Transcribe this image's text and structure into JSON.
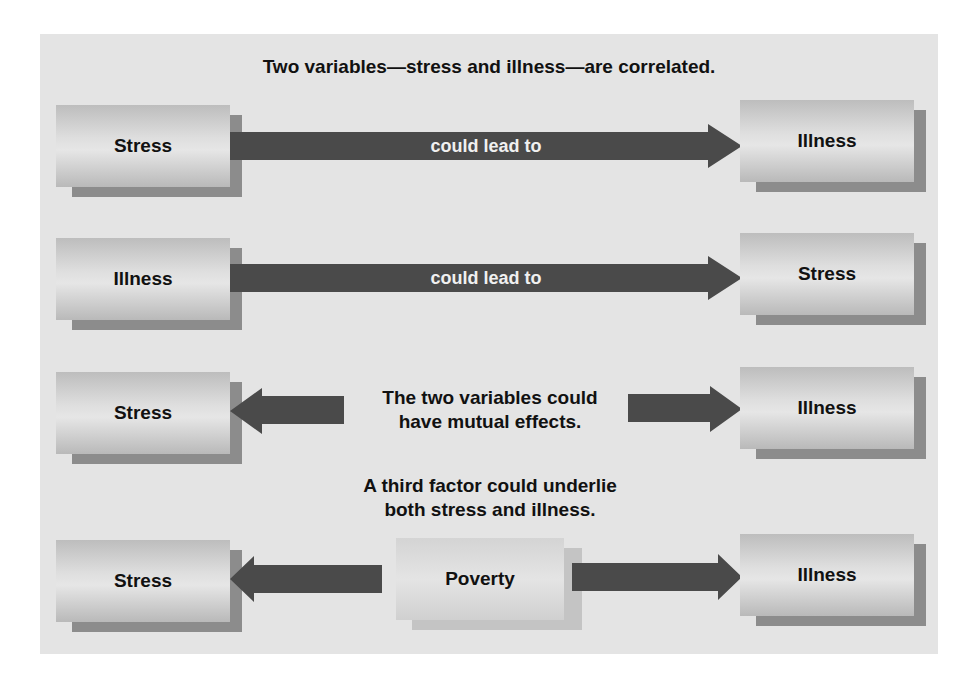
{
  "title": "Two variables—stress and illness—are correlated.",
  "colors": {
    "panel": "#e4e4e4",
    "arrow": "#4a4a4a",
    "arrow_text": "#f0f0f0",
    "box_shadow": "#8c8c8c"
  },
  "rows": [
    {
      "left": "Stress",
      "right": "Illness",
      "arrow_label": "could lead to",
      "direction": "left-to-right"
    },
    {
      "left": "Illness",
      "right": "Stress",
      "arrow_label": "could lead to",
      "direction": "left-to-right"
    },
    {
      "left": "Stress",
      "right": "Illness",
      "middle_text": [
        "The two variables could",
        "have mutual effects."
      ],
      "direction": "bidirectional"
    },
    {
      "caption": [
        "A third factor could underlie",
        "both stress and illness."
      ],
      "left": "Stress",
      "center": "Poverty",
      "right": "Illness",
      "direction": "center-outward"
    }
  ]
}
